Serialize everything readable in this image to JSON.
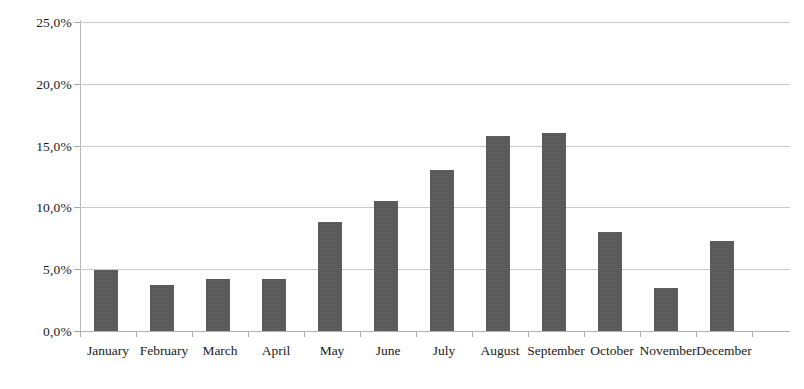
{
  "chart_data": {
    "type": "bar",
    "title": "",
    "subtitle": "",
    "xlabel": "",
    "ylabel": "",
    "legend": [],
    "legend_position": "none",
    "grid": true,
    "grid_axis": "y",
    "ylim": [
      0,
      25
    ],
    "ytick_step": 5,
    "decimal_separator": ",",
    "value_unit": "%",
    "bar_color": "#595959",
    "gridline_color": "#c9c9c9",
    "axis_color": "#b0b0b0",
    "categories": [
      "January",
      "February",
      "March",
      "April",
      "May",
      "June",
      "July",
      "August",
      "September",
      "October",
      "November",
      "December"
    ],
    "values": [
      4.9,
      3.7,
      4.2,
      4.2,
      8.8,
      10.5,
      13.0,
      15.8,
      16.0,
      8.0,
      3.5,
      7.3
    ],
    "ytick_labels": [
      "0,0%",
      "5,0%",
      "10,0%",
      "15,0%",
      "20,0%",
      "25,0%"
    ],
    "ytick_values": [
      0,
      5,
      10,
      15,
      20,
      25
    ]
  }
}
